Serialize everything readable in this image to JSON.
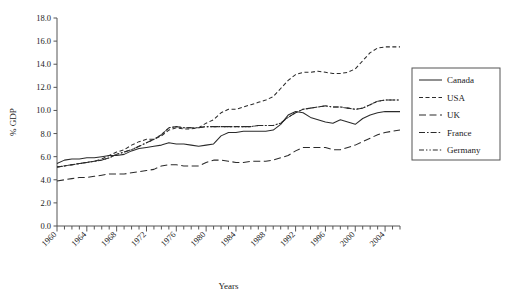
{
  "chart_data": {
    "type": "line",
    "title": "",
    "xlabel": "Years",
    "ylabel": "% GDP",
    "xlim": [
      1960,
      2006
    ],
    "ylim": [
      0.0,
      18.0
    ],
    "ytick_step": 2.0,
    "grid": false,
    "legend_position": "right-outside",
    "yticks": [
      "0.0",
      "2.0",
      "4.0",
      "6.0",
      "8.0",
      "10.0",
      "12.0",
      "14.0",
      "16.0",
      "18.0"
    ],
    "xticks": [
      "1960",
      "1964",
      "1968",
      "1972",
      "1976",
      "1980",
      "1984",
      "1988",
      "1992",
      "1996",
      "2000",
      "2004"
    ],
    "x": [
      1960,
      1961,
      1962,
      1963,
      1964,
      1965,
      1966,
      1967,
      1968,
      1969,
      1970,
      1971,
      1972,
      1973,
      1974,
      1975,
      1976,
      1977,
      1978,
      1979,
      1980,
      1981,
      1982,
      1983,
      1984,
      1985,
      1986,
      1987,
      1988,
      1989,
      1990,
      1991,
      1992,
      1993,
      1994,
      1995,
      1996,
      1997,
      1998,
      1999,
      2000,
      2001,
      2002,
      2003,
      2004,
      2005,
      2006
    ],
    "series": [
      {
        "name": "Canada",
        "dash": "none",
        "values": [
          5.4,
          5.7,
          5.8,
          5.8,
          5.9,
          5.9,
          6.0,
          6.1,
          6.1,
          6.2,
          6.5,
          6.7,
          6.8,
          6.9,
          7.0,
          7.2,
          7.1,
          7.1,
          7.0,
          6.9,
          7.0,
          7.1,
          7.8,
          8.1,
          8.1,
          8.2,
          8.2,
          8.2,
          8.2,
          8.3,
          8.8,
          9.6,
          9.9,
          9.8,
          9.4,
          9.2,
          9.0,
          8.9,
          9.2,
          9.0,
          8.8,
          9.3,
          9.6,
          9.8,
          9.9,
          9.9,
          9.9
        ]
      },
      {
        "name": "USA",
        "dash": "dashed",
        "values": [
          5.1,
          5.2,
          5.3,
          5.4,
          5.5,
          5.6,
          5.8,
          6.1,
          6.4,
          6.6,
          7.0,
          7.3,
          7.5,
          7.5,
          7.8,
          8.3,
          8.5,
          8.4,
          8.4,
          8.5,
          8.9,
          9.2,
          9.8,
          10.1,
          10.1,
          10.3,
          10.5,
          10.7,
          10.9,
          11.2,
          11.9,
          12.6,
          13.1,
          13.3,
          13.3,
          13.4,
          13.3,
          13.2,
          13.2,
          13.3,
          13.6,
          14.3,
          15.0,
          15.4,
          15.5,
          15.5,
          15.5
        ]
      },
      {
        "name": "UK",
        "dash": "longdash",
        "values": [
          3.9,
          4.0,
          4.1,
          4.2,
          4.2,
          4.3,
          4.4,
          4.5,
          4.5,
          4.5,
          4.6,
          4.7,
          4.8,
          4.9,
          5.2,
          5.3,
          5.3,
          5.2,
          5.2,
          5.2,
          5.5,
          5.7,
          5.7,
          5.6,
          5.5,
          5.5,
          5.6,
          5.6,
          5.6,
          5.7,
          5.9,
          6.1,
          6.5,
          6.8,
          6.8,
          6.8,
          6.8,
          6.6,
          6.6,
          6.8,
          7.0,
          7.3,
          7.6,
          7.9,
          8.1,
          8.2,
          8.3
        ]
      },
      {
        "name": "France",
        "dash": "dashdot",
        "values": [
          5.1,
          5.2,
          5.3,
          5.4,
          5.5,
          5.6,
          5.7,
          5.9,
          6.2,
          6.4,
          6.6,
          6.9,
          7.2,
          7.5,
          7.9,
          8.5,
          8.6,
          8.5,
          8.5,
          8.5,
          8.6,
          8.6,
          8.6,
          8.6,
          8.6,
          8.6,
          8.6,
          8.7,
          8.7,
          8.7,
          8.9,
          9.4,
          9.8,
          10.1,
          10.2,
          10.3,
          10.4,
          10.3,
          10.3,
          10.2,
          10.1,
          10.2,
          10.5,
          10.8,
          10.9,
          10.9,
          10.9
        ]
      },
      {
        "name": "Germany",
        "dash": "dashdotdot",
        "values": [
          5.1,
          5.2,
          5.3,
          5.4,
          5.5,
          5.6,
          5.7,
          5.9,
          6.2,
          6.4,
          6.6,
          6.9,
          7.2,
          7.5,
          7.9,
          8.5,
          8.6,
          8.5,
          8.5,
          8.5,
          8.6,
          8.6,
          8.6,
          8.6,
          8.6,
          8.6,
          8.6,
          8.7,
          8.7,
          8.7,
          8.9,
          9.4,
          9.8,
          10.1,
          10.2,
          10.3,
          10.4,
          10.3,
          10.3,
          10.2,
          10.1,
          10.2,
          10.5,
          10.8,
          10.9,
          10.9,
          10.9
        ]
      }
    ],
    "legend": [
      {
        "label": "Canada",
        "dash": "none"
      },
      {
        "label": "USA",
        "dash": "dashed"
      },
      {
        "label": "UK",
        "dash": "longdash"
      },
      {
        "label": "France",
        "dash": "dashdot"
      },
      {
        "label": "Germany",
        "dash": "dashdotdot"
      }
    ]
  }
}
